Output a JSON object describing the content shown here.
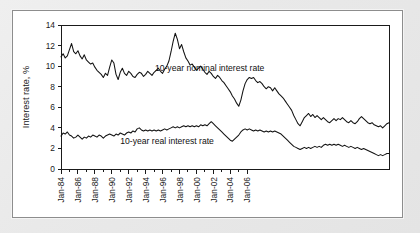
{
  "figure": {
    "panel_background": "#ffffff",
    "outer_background": "#e8e8e8",
    "border_color": "#8d8d8d",
    "line_color": "#121212"
  },
  "chart_data": {
    "type": "line",
    "title": "",
    "subtitle": "",
    "xlabel": "",
    "ylabel": "Interest rate, %",
    "ylim": [
      0,
      14
    ],
    "ytick_values": [
      0,
      2,
      4,
      6,
      8,
      10,
      12,
      14
    ],
    "ytick_labels": [
      "0",
      "2",
      "4",
      "6",
      "8",
      "10",
      "12",
      "14"
    ],
    "xlim": [
      "Jan-84",
      "Jan-07"
    ],
    "xtick_labels": [
      "Jan-84",
      "Jan-86",
      "Jan-88",
      "Jan-90",
      "Jan-92",
      "Jan-94",
      "Jan-96",
      "Jan-98",
      "Jan-00",
      "Jan-02",
      "Jan-04",
      "Jan-06"
    ],
    "xtick_years": [
      1984,
      1986,
      1988,
      1990,
      1992,
      1994,
      1996,
      1998,
      2000,
      2002,
      2004,
      2006
    ],
    "xminor_years": [
      1985,
      1987,
      1989,
      1991,
      1993,
      1995,
      1997,
      1999,
      2001,
      2003,
      2005
    ],
    "xtick_label_rotation": -90,
    "grid": false,
    "legend": "inline-annotations",
    "annotations": [
      {
        "id": "nominal",
        "text": "10-year nominal interest rate",
        "x_year": 1995.1,
        "y_value": 9.55
      },
      {
        "id": "real",
        "text": "10-year real interest rate",
        "x_year": 1991.0,
        "y_value": 2.45
      }
    ],
    "x_start_year": 1984.0,
    "x_step_years": 0.25,
    "series": [
      {
        "name": "10-year nominal interest rate",
        "values": [
          10.9,
          11.2,
          10.8,
          11.0,
          11.6,
          12.2,
          11.4,
          11.2,
          11.5,
          11.0,
          10.7,
          11.1,
          10.6,
          10.4,
          10.2,
          10.3,
          9.9,
          9.6,
          9.4,
          9.2,
          8.9,
          9.3,
          9.1,
          9.9,
          10.6,
          10.3,
          9.2,
          8.7,
          9.4,
          9.8,
          9.3,
          9.1,
          9.5,
          9.3,
          9.0,
          8.9,
          9.2,
          9.4,
          9.3,
          9.0,
          9.2,
          9.5,
          9.3,
          9.1,
          9.4,
          9.6,
          9.8,
          9.5,
          9.3,
          9.7,
          10.0,
          10.5,
          11.4,
          12.4,
          13.2,
          12.6,
          11.7,
          12.1,
          11.4,
          10.8,
          10.5,
          10.1,
          10.2,
          9.9,
          9.6,
          9.8,
          10.0,
          9.7,
          9.4,
          9.2,
          9.5,
          9.3,
          9.0,
          8.8,
          9.1,
          8.9,
          8.6,
          8.4,
          8.1,
          7.8,
          7.5,
          7.1,
          6.8,
          6.4,
          6.1,
          6.7,
          7.6,
          8.3,
          8.7,
          8.9,
          8.8,
          8.9,
          8.6,
          8.4,
          8.5,
          8.3,
          8.0,
          7.8,
          8.0,
          7.9,
          7.6,
          7.9,
          7.6,
          7.3,
          7.1,
          6.9,
          6.6,
          6.3,
          6.0,
          5.7,
          5.2,
          4.8,
          4.4,
          4.2,
          4.6,
          5.0,
          5.2,
          5.4,
          5.1,
          5.3,
          5.0,
          5.2,
          5.0,
          4.8,
          5.0,
          4.8,
          4.6,
          4.5,
          4.7,
          4.9,
          4.7,
          4.9,
          4.8,
          5.0,
          4.8,
          4.6,
          4.5,
          4.7,
          4.5,
          4.4,
          4.6,
          4.9,
          5.1,
          4.9,
          4.7,
          4.5,
          4.4,
          4.5,
          4.3,
          4.2,
          4.1,
          4.2,
          4.0,
          4.2,
          4.4,
          4.5
        ]
      },
      {
        "name": "10-year real interest rate",
        "values": [
          3.2,
          3.5,
          3.4,
          3.6,
          3.3,
          3.2,
          3.0,
          3.1,
          3.3,
          3.1,
          2.9,
          3.1,
          3.0,
          3.2,
          3.1,
          3.3,
          3.2,
          3.1,
          3.3,
          3.2,
          3.0,
          3.2,
          3.3,
          3.4,
          3.3,
          3.2,
          3.4,
          3.3,
          3.5,
          3.4,
          3.3,
          3.5,
          3.6,
          3.5,
          3.7,
          3.6,
          3.9,
          4.0,
          3.8,
          3.7,
          3.8,
          3.7,
          3.8,
          3.7,
          3.8,
          3.7,
          3.8,
          3.7,
          3.8,
          3.9,
          3.8,
          3.9,
          4.0,
          4.1,
          4.0,
          4.1,
          4.0,
          4.1,
          4.2,
          4.1,
          4.2,
          4.1,
          4.2,
          4.1,
          4.2,
          4.1,
          4.3,
          4.2,
          4.3,
          4.2,
          4.4,
          4.6,
          4.4,
          4.2,
          4.0,
          3.8,
          3.6,
          3.4,
          3.2,
          3.0,
          2.8,
          2.7,
          2.9,
          3.1,
          3.3,
          3.6,
          3.8,
          3.9,
          3.8,
          3.9,
          3.8,
          3.7,
          3.8,
          3.7,
          3.8,
          3.7,
          3.6,
          3.7,
          3.6,
          3.7,
          3.6,
          3.7,
          3.6,
          3.5,
          3.4,
          3.2,
          3.0,
          2.8,
          2.6,
          2.4,
          2.2,
          2.1,
          2.0,
          1.9,
          2.0,
          2.1,
          2.0,
          2.1,
          2.0,
          2.1,
          2.2,
          2.1,
          2.2,
          2.1,
          2.3,
          2.4,
          2.3,
          2.4,
          2.3,
          2.4,
          2.3,
          2.4,
          2.3,
          2.2,
          2.3,
          2.2,
          2.1,
          2.2,
          2.1,
          2.0,
          2.1,
          2.0,
          1.9,
          2.0,
          1.9,
          1.8,
          1.7,
          1.6,
          1.5,
          1.4,
          1.3,
          1.4,
          1.3,
          1.4,
          1.5,
          1.5
        ]
      }
    ]
  }
}
